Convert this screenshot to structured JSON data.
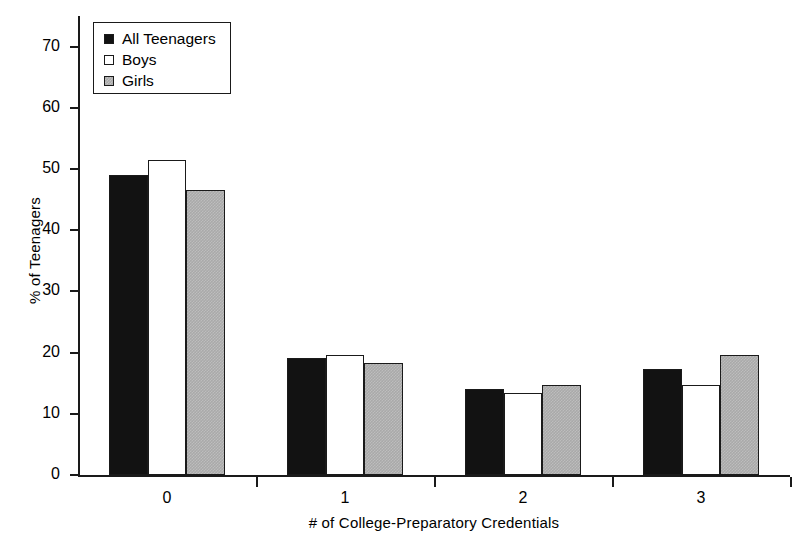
{
  "chart_data": {
    "type": "bar",
    "title": "",
    "subtitle": "",
    "xlabel": "# of College-Preparatory Credentials",
    "ylabel": "% of Teenagers",
    "categories": [
      "0",
      "1",
      "2",
      "3"
    ],
    "series": [
      {
        "name": "All Teenagers",
        "color": "#121212",
        "values": [
          49.1,
          19.1,
          14.1,
          17.3
        ]
      },
      {
        "name": "Boys",
        "color": "#ffffff",
        "values": [
          51.5,
          19.6,
          13.4,
          14.7
        ]
      },
      {
        "name": "Girls",
        "color": "#a9a9a9",
        "values": [
          46.6,
          18.3,
          14.7,
          19.6
        ]
      }
    ],
    "ylim": [
      0,
      75
    ],
    "yticks": [
      0,
      10,
      20,
      30,
      40,
      50,
      60,
      70
    ],
    "ytick_labels": [
      "0",
      "10",
      "20",
      "30",
      "40",
      "50",
      "60",
      "70"
    ],
    "grid": false,
    "legend_position": "top-left"
  },
  "legend": {
    "items": [
      {
        "label": "All Teenagers",
        "swatch": "black-square-icon"
      },
      {
        "label": "Boys",
        "swatch": "white-square-icon"
      },
      {
        "label": "Girls",
        "swatch": "gray-square-icon"
      }
    ]
  }
}
